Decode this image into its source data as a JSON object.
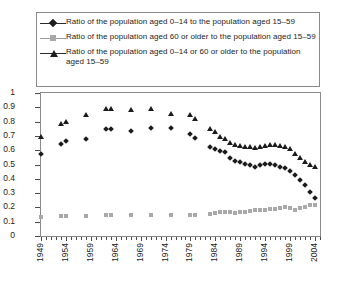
{
  "chart_data": {
    "type": "scatter",
    "title": "",
    "subtitle": "",
    "xlabel": "",
    "ylabel": "",
    "xlim": [
      1949,
      2005
    ],
    "ylim": [
      0,
      1
    ],
    "y_ticks": [
      "0",
      "0.1",
      "0.2",
      "0.3",
      "0.4",
      "0.5",
      "0.6",
      "0.7",
      "0.8",
      "0.9",
      "1"
    ],
    "y_tick_values": [
      0,
      0.1,
      0.2,
      0.3,
      0.4,
      0.5,
      0.6,
      0.7,
      0.8,
      0.9,
      1
    ],
    "x_tick_labels": [
      "1949",
      "1954",
      "1959",
      "1964",
      "1969",
      "1974",
      "1979",
      "1984",
      "1989",
      "1994",
      "1999",
      "2004"
    ],
    "x_tick_values": [
      1949,
      1954,
      1959,
      1964,
      1969,
      1974,
      1979,
      1984,
      1989,
      1994,
      1999,
      2004
    ],
    "x_minor_tick_step": 1,
    "grid": false,
    "legend_position": "top",
    "series": [
      {
        "name": "Ratio of the population aged 0–14 to the population aged 15–59",
        "marker": "diamond",
        "color": "#1b1b1b",
        "points": [
          [
            1949,
            0.575
          ],
          [
            1953,
            0.645
          ],
          [
            1954,
            0.665
          ],
          [
            1958,
            0.675
          ],
          [
            1962,
            0.745
          ],
          [
            1963,
            0.745
          ],
          [
            1967,
            0.735
          ],
          [
            1971,
            0.755
          ],
          [
            1975,
            0.755
          ],
          [
            1979,
            0.715
          ],
          [
            1980,
            0.685
          ],
          [
            1983,
            0.625
          ],
          [
            1984,
            0.605
          ],
          [
            1985,
            0.595
          ],
          [
            1986,
            0.585
          ],
          [
            1987,
            0.545
          ],
          [
            1988,
            0.525
          ],
          [
            1989,
            0.515
          ],
          [
            1990,
            0.505
          ],
          [
            1991,
            0.495
          ],
          [
            1992,
            0.485
          ],
          [
            1993,
            0.495
          ],
          [
            1994,
            0.505
          ],
          [
            1995,
            0.505
          ],
          [
            1996,
            0.495
          ],
          [
            1997,
            0.485
          ],
          [
            1998,
            0.475
          ],
          [
            1999,
            0.455
          ],
          [
            2000,
            0.425
          ],
          [
            2001,
            0.395
          ],
          [
            2002,
            0.355
          ],
          [
            2003,
            0.305
          ],
          [
            2004,
            0.265
          ]
        ]
      },
      {
        "name": "Ratio of the population aged 60 or older to the population aged 15–59",
        "marker": "square",
        "color": "#a9a9a9",
        "points": [
          [
            1949,
            0.135
          ],
          [
            1953,
            0.14
          ],
          [
            1954,
            0.14
          ],
          [
            1958,
            0.14
          ],
          [
            1962,
            0.145
          ],
          [
            1963,
            0.145
          ],
          [
            1967,
            0.145
          ],
          [
            1971,
            0.145
          ],
          [
            1975,
            0.145
          ],
          [
            1979,
            0.15
          ],
          [
            1980,
            0.15
          ],
          [
            1983,
            0.155
          ],
          [
            1984,
            0.16
          ],
          [
            1985,
            0.165
          ],
          [
            1986,
            0.17
          ],
          [
            1987,
            0.165
          ],
          [
            1988,
            0.16
          ],
          [
            1989,
            0.165
          ],
          [
            1990,
            0.17
          ],
          [
            1991,
            0.175
          ],
          [
            1992,
            0.18
          ],
          [
            1993,
            0.18
          ],
          [
            1994,
            0.185
          ],
          [
            1995,
            0.19
          ],
          [
            1996,
            0.19
          ],
          [
            1997,
            0.195
          ],
          [
            1998,
            0.2
          ],
          [
            1999,
            0.195
          ],
          [
            2000,
            0.185
          ],
          [
            2001,
            0.195
          ],
          [
            2002,
            0.205
          ],
          [
            2003,
            0.215
          ],
          [
            2004,
            0.22
          ]
        ]
      },
      {
        "name": "Ratio of the population aged 0–14 or 60 or older to the population aged 15–59",
        "marker": "triangle",
        "color": "#1b1b1b",
        "points": [
          [
            1949,
            0.695
          ],
          [
            1953,
            0.78
          ],
          [
            1954,
            0.8
          ],
          [
            1958,
            0.845
          ],
          [
            1962,
            0.89
          ],
          [
            1963,
            0.89
          ],
          [
            1967,
            0.88
          ],
          [
            1971,
            0.885
          ],
          [
            1975,
            0.855
          ],
          [
            1979,
            0.845
          ],
          [
            1980,
            0.815
          ],
          [
            1983,
            0.745
          ],
          [
            1984,
            0.725
          ],
          [
            1985,
            0.695
          ],
          [
            1986,
            0.68
          ],
          [
            1987,
            0.65
          ],
          [
            1988,
            0.635
          ],
          [
            1989,
            0.63
          ],
          [
            1990,
            0.625
          ],
          [
            1991,
            0.62
          ],
          [
            1992,
            0.615
          ],
          [
            1993,
            0.62
          ],
          [
            1994,
            0.63
          ],
          [
            1995,
            0.635
          ],
          [
            1996,
            0.635
          ],
          [
            1997,
            0.63
          ],
          [
            1998,
            0.625
          ],
          [
            1999,
            0.605
          ],
          [
            2000,
            0.575
          ],
          [
            2001,
            0.545
          ],
          [
            2002,
            0.52
          ],
          [
            2003,
            0.495
          ],
          [
            2004,
            0.48
          ]
        ]
      }
    ]
  },
  "legend": {
    "items": [
      {
        "marker": "diamond-marker",
        "label": "Ratio of the population aged 0–14 to the population aged 15–59"
      },
      {
        "marker": "square-marker",
        "label": "Ratio of the population aged 60 or older to the population aged 15–59"
      },
      {
        "marker": "triangle-marker",
        "label": "Ratio of the population aged 0–14 or 60 or older to the population aged 15–59"
      }
    ]
  }
}
